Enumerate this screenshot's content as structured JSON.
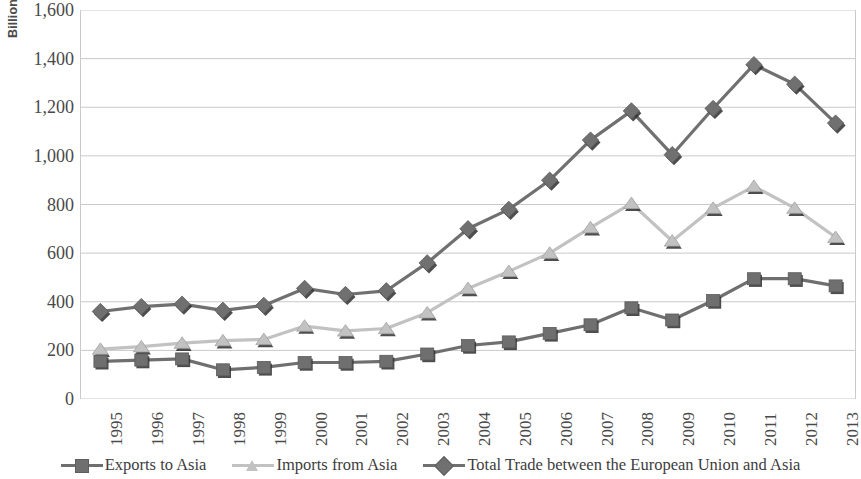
{
  "axis": {
    "y_title": "Billions",
    "y_ticks": [
      "1,600",
      "1,400",
      "1,200",
      "1,000",
      "800",
      "600",
      "400",
      "200",
      "0"
    ]
  },
  "legend": {
    "items": [
      {
        "label": "Exports to Asia",
        "marker": "square-marker",
        "color": "#6f6f6f"
      },
      {
        "label": "Imports from Asia",
        "marker": "triangle-marker",
        "color": "#c2c2c2"
      },
      {
        "label": "Total Trade between the European Union and Asia",
        "marker": "diamond-marker",
        "color": "#707070"
      }
    ]
  },
  "chart_data": {
    "type": "line",
    "title": "",
    "xlabel": "",
    "ylabel": "Billions",
    "ylim": [
      0,
      1600
    ],
    "ytick_step": 200,
    "grid": true,
    "legend_position": "bottom",
    "categories": [
      "1995",
      "1996",
      "1997",
      "1998",
      "1999",
      "2000",
      "2001",
      "2002",
      "2003",
      "2004",
      "2005",
      "2006",
      "2007",
      "2008",
      "2009",
      "2010",
      "2011",
      "2012",
      "2013"
    ],
    "series": [
      {
        "name": "Exports to Asia",
        "color": "#6f6f6f",
        "marker": "square",
        "values": [
          155,
          160,
          165,
          120,
          130,
          150,
          150,
          155,
          185,
          220,
          235,
          270,
          305,
          375,
          325,
          405,
          495,
          495,
          465
        ]
      },
      {
        "name": "Imports from Asia",
        "color": "#c2c2c2",
        "marker": "triangle",
        "values": [
          205,
          215,
          230,
          240,
          245,
          300,
          280,
          290,
          355,
          455,
          525,
          600,
          705,
          805,
          650,
          785,
          875,
          785,
          665
        ]
      },
      {
        "name": "Total Trade between the European Union and Asia",
        "color": "#707070",
        "marker": "diamond",
        "values": [
          360,
          380,
          390,
          365,
          385,
          455,
          430,
          445,
          560,
          700,
          780,
          900,
          1065,
          1185,
          1005,
          1195,
          1375,
          1295,
          1135
        ]
      }
    ]
  }
}
